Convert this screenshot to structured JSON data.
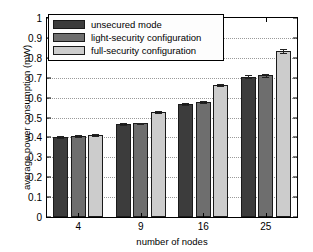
{
  "chart_data": {
    "type": "bar",
    "title": "",
    "xlabel": "number of nodes",
    "ylabel": "average power consumption (mW)",
    "categories": [
      "4",
      "9",
      "16",
      "25"
    ],
    "ylim": [
      0,
      1
    ],
    "ytick_labels": [
      "0",
      "0.1",
      "0.2",
      "0.3",
      "0.4",
      "0.5",
      "0.6",
      "0.7",
      "0.8",
      "0.9",
      "1"
    ],
    "ytick_values": [
      0,
      0.1,
      0.2,
      0.3,
      0.4,
      0.5,
      0.6,
      0.7,
      0.8,
      0.9,
      1
    ],
    "grid": true,
    "legend_position": "top-left",
    "series": [
      {
        "name": "unsecured mode",
        "color": "#3c3c3c",
        "values": [
          0.402,
          0.466,
          0.568,
          0.705
        ],
        "errors": [
          0.004,
          0.004,
          0.005,
          0.008
        ]
      },
      {
        "name": "light-security configuration",
        "color": "#6e6e6e",
        "values": [
          0.407,
          0.47,
          0.578,
          0.712
        ],
        "errors": [
          0.004,
          0.004,
          0.005,
          0.008
        ]
      },
      {
        "name": "full-security configuration",
        "color": "#cccccc",
        "values": [
          0.412,
          0.528,
          0.662,
          0.835
        ],
        "errors": [
          0.004,
          0.005,
          0.006,
          0.01
        ]
      }
    ]
  }
}
